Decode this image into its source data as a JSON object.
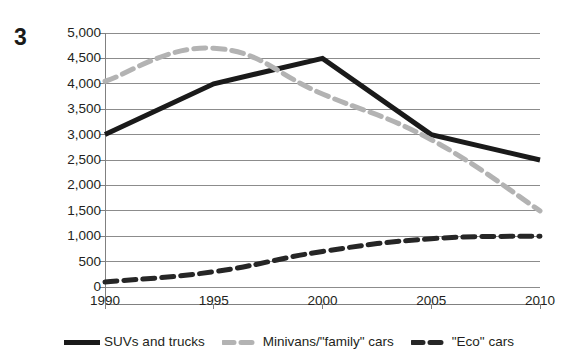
{
  "figure": {
    "number": "3"
  },
  "chart_data": {
    "type": "line",
    "title": "",
    "subtitle": "",
    "xlabel": "",
    "ylabel": "",
    "x": [
      1990,
      1995,
      2000,
      2005,
      2010
    ],
    "categories": [
      "1990",
      "1995",
      "2000",
      "2005",
      "2010"
    ],
    "xlim": [
      1990,
      2010
    ],
    "ylim": [
      0,
      5000
    ],
    "y_ticks": [
      0,
      500,
      1000,
      1500,
      2000,
      2500,
      3000,
      3500,
      4000,
      4500,
      5000
    ],
    "y_tick_labels": [
      "0",
      "500",
      "1,000",
      "1,500",
      "2,000",
      "2,500",
      "3,000",
      "3,500",
      "4,000",
      "4,500",
      "5,000"
    ],
    "x_tick_labels": [
      "1990",
      "1995",
      "2000",
      "2005",
      "2010"
    ],
    "grid": true,
    "grid_axis": "y",
    "legend_position": "bottom",
    "series": [
      {
        "name": "SUVs and trucks",
        "values": [
          3000,
          4000,
          4500,
          3000,
          2500
        ],
        "color": "#1a1a1a",
        "style": "solid",
        "width": 5
      },
      {
        "name": "Minivans/\"family\" cars",
        "values": [
          4050,
          4700,
          3800,
          2900,
          1500
        ],
        "color": "#b3b3b3",
        "style": "dashed",
        "width": 5
      },
      {
        "name": "\"Eco\" cars",
        "values": [
          100,
          300,
          700,
          950,
          1000
        ],
        "color": "#262626",
        "style": "dashed",
        "width": 5
      }
    ]
  },
  "legend": {
    "items": [
      {
        "label": "SUVs and trucks",
        "color": "#1a1a1a",
        "style": "solid"
      },
      {
        "label": "Minivans/\"family\" cars",
        "color": "#b3b3b3",
        "style": "dashed"
      },
      {
        "label": "\"Eco\" cars",
        "color": "#262626",
        "style": "dashed"
      }
    ]
  },
  "axes": {
    "y_labels": [
      "5,000",
      "4,500",
      "4,000",
      "3,500",
      "3,000",
      "2,500",
      "2,000",
      "1,500",
      "1,000",
      "500",
      "0"
    ],
    "x_labels": [
      "1990",
      "1995",
      "2000",
      "2005",
      "2010"
    ]
  },
  "colors": {
    "axis": "#808080",
    "gridline": "#8c8c8c",
    "text": "#231f20",
    "series_suv": "#1a1a1a",
    "series_minivan": "#b3b3b3",
    "series_eco": "#262626"
  }
}
